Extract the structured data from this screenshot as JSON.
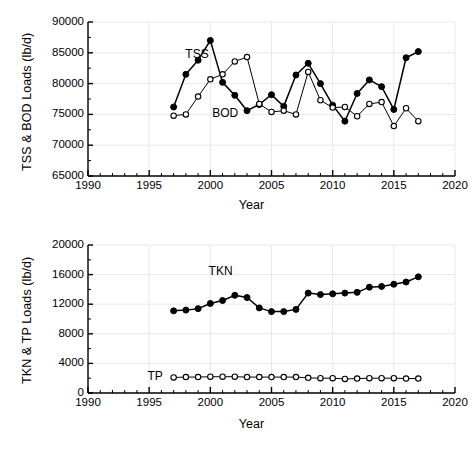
{
  "figure": {
    "background": "#ffffff",
    "line_color": "#000000",
    "marker_filled_color": "#000000",
    "marker_open_fill": "#ffffff",
    "grid_color": "#e8e8e8"
  },
  "chart_data": [
    {
      "id": "top",
      "type": "line",
      "title": "",
      "xlabel": "Year",
      "ylabel": "TSS & BOD Loads (lb/d)",
      "xlim": [
        1990,
        2020
      ],
      "ylim": [
        65000,
        90000
      ],
      "xticks": [
        1990,
        1995,
        2000,
        2005,
        2010,
        2015,
        2020
      ],
      "xtick_labels": [
        "1990",
        "1995",
        "2000",
        "2005",
        "2010",
        "2015",
        "2020"
      ],
      "xminor_step": 1,
      "yticks": [
        65000,
        70000,
        75000,
        80000,
        85000,
        90000
      ],
      "ytick_labels": [
        "65000",
        "70000",
        "75000",
        "80000",
        "85000",
        "90000"
      ],
      "grid": true,
      "legend": "inline-annotations",
      "x": [
        1997,
        1998,
        1999,
        2000,
        2001,
        2002,
        2003,
        2004,
        2005,
        2006,
        2007,
        2008,
        2009,
        2010,
        2011,
        2012,
        2013,
        2014,
        2015,
        2016,
        2017
      ],
      "series": [
        {
          "name": "TSS",
          "marker": "filled-circle",
          "label_x": 1999.1,
          "label_y": 84700,
          "values": [
            76200,
            81500,
            83800,
            87000,
            80200,
            78100,
            75600,
            76600,
            78200,
            76300,
            81400,
            83300,
            80000,
            76500,
            73900,
            78400,
            80600,
            79500,
            75800,
            84200,
            85200
          ]
        },
        {
          "name": "BOD",
          "marker": "open-circle",
          "label_x": 2001.3,
          "label_y": 75000,
          "values": [
            74800,
            75000,
            77900,
            80700,
            81500,
            83600,
            84300,
            76700,
            75400,
            75600,
            75000,
            81900,
            77300,
            76100,
            76200,
            74700,
            76700,
            77000,
            73100,
            76000,
            73900
          ]
        }
      ]
    },
    {
      "id": "bottom",
      "type": "line",
      "title": "",
      "xlabel": "Year",
      "ylabel": "TKN & TP Loads (lb/d)",
      "xlim": [
        1990,
        2020
      ],
      "ylim": [
        0,
        20000
      ],
      "xticks": [
        1990,
        1995,
        2000,
        2005,
        2010,
        2015,
        2020
      ],
      "xtick_labels": [
        "1990",
        "1995",
        "2000",
        "2005",
        "2010",
        "2015",
        "2020"
      ],
      "xminor_step": 1,
      "yticks": [
        0,
        4000,
        8000,
        12000,
        16000,
        20000
      ],
      "ytick_labels": [
        "0",
        "4000",
        "8000",
        "12000",
        "16000",
        "20000"
      ],
      "grid": true,
      "legend": "inline-annotations",
      "x": [
        1997,
        1998,
        1999,
        2000,
        2001,
        2002,
        2003,
        2004,
        2005,
        2006,
        2007,
        2008,
        2009,
        2010,
        2011,
        2012,
        2013,
        2014,
        2015,
        2016,
        2017
      ],
      "series": [
        {
          "name": "TKN",
          "marker": "filled-circle",
          "label_x": 2001.0,
          "label_y": 16400,
          "values": [
            11100,
            11200,
            11400,
            12100,
            12500,
            13200,
            12900,
            11500,
            11000,
            11000,
            11300,
            13500,
            13300,
            13400,
            13500,
            13600,
            14300,
            14400,
            14700,
            15000,
            15700
          ]
        },
        {
          "name": "TP",
          "marker": "open-circle",
          "label_x": 1996.0,
          "label_y": 2150,
          "values": [
            2100,
            2150,
            2150,
            2200,
            2200,
            2200,
            2150,
            2150,
            2150,
            2150,
            2150,
            2050,
            2000,
            2000,
            1900,
            1950,
            2000,
            2000,
            2000,
            1950,
            1950
          ]
        }
      ]
    }
  ]
}
